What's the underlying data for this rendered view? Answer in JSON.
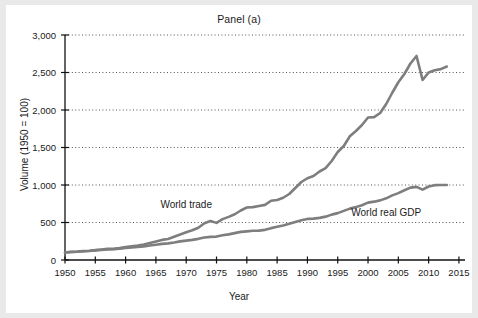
{
  "figure": {
    "title": "Panel (a)",
    "background": "#ffffff",
    "outer_background": "#e9e9e9"
  },
  "chart_data": {
    "type": "line",
    "title": "Panel (a)",
    "xlabel": "Year",
    "ylabel": "Volume (1950 = 100)",
    "xlim": [
      1950,
      2016
    ],
    "ylim": [
      0,
      3000
    ],
    "grid": true,
    "grid_style": "dotted-horizontal",
    "legend": "inline-annotations",
    "yticks": [
      0,
      500,
      1000,
      1500,
      2000,
      2500,
      3000
    ],
    "ytick_labels": [
      "0",
      "500",
      "1,000",
      "1,500",
      "2,000",
      "2,500",
      "3,000"
    ],
    "xticks": [
      1950,
      1955,
      1960,
      1965,
      1970,
      1975,
      1980,
      1985,
      1990,
      1995,
      2000,
      2005,
      2010,
      2015
    ],
    "xtick_labels": [
      "1950",
      "1955",
      "1960",
      "1965",
      "1970",
      "1975",
      "1980",
      "1985",
      "1990",
      "1995",
      "2000",
      "2005",
      "2010",
      "2015"
    ],
    "line_color": "#7e7e7e",
    "line_width": 2.6,
    "x": [
      1950,
      1951,
      1952,
      1953,
      1954,
      1955,
      1956,
      1957,
      1958,
      1959,
      1960,
      1961,
      1962,
      1963,
      1964,
      1965,
      1966,
      1967,
      1968,
      1969,
      1970,
      1971,
      1972,
      1973,
      1974,
      1975,
      1976,
      1977,
      1978,
      1979,
      1980,
      1981,
      1982,
      1983,
      1984,
      1985,
      1986,
      1987,
      1988,
      1989,
      1990,
      1991,
      1992,
      1993,
      1994,
      1995,
      1996,
      1997,
      1998,
      1999,
      2000,
      2001,
      2002,
      2003,
      2004,
      2005,
      2006,
      2007,
      2008,
      2009,
      2010,
      2011,
      2012,
      2013
    ],
    "series": [
      {
        "name": "World trade",
        "label": "World trade",
        "color": "#7e7e7e",
        "values": [
          100,
          108,
          112,
          118,
          124,
          132,
          140,
          148,
          148,
          158,
          172,
          182,
          192,
          206,
          228,
          246,
          268,
          280,
          310,
          340,
          370,
          396,
          430,
          490,
          520,
          495,
          545,
          575,
          610,
          660,
          700,
          705,
          720,
          735,
          790,
          800,
          830,
          880,
          960,
          1040,
          1090,
          1120,
          1180,
          1225,
          1320,
          1440,
          1520,
          1650,
          1720,
          1800,
          1900,
          1905,
          1960,
          2080,
          2230,
          2370,
          2480,
          2620,
          2720,
          2400,
          2500,
          2530,
          2545,
          2580
        ]
      },
      {
        "name": "World real GDP",
        "label": "World real GDP",
        "color": "#7e7e7e",
        "values": [
          100,
          106,
          110,
          116,
          120,
          128,
          134,
          140,
          144,
          152,
          160,
          166,
          174,
          182,
          194,
          204,
          215,
          222,
          234,
          248,
          258,
          268,
          282,
          300,
          308,
          312,
          330,
          342,
          358,
          375,
          382,
          390,
          392,
          402,
          425,
          442,
          460,
          482,
          508,
          530,
          548,
          552,
          562,
          578,
          605,
          625,
          655,
          685,
          705,
          730,
          765,
          778,
          795,
          822,
          862,
          892,
          930,
          965,
          975,
          938,
          980,
          998,
          1000,
          1000
        ]
      }
    ],
    "annotations": [
      {
        "text": "World trade",
        "x": 1970,
        "y": 690
      },
      {
        "text": "World real GDP",
        "x": 2003,
        "y": 590
      }
    ]
  },
  "axes": {
    "xlabel": "Year",
    "ylabel": "Volume (1950 = 100)"
  }
}
